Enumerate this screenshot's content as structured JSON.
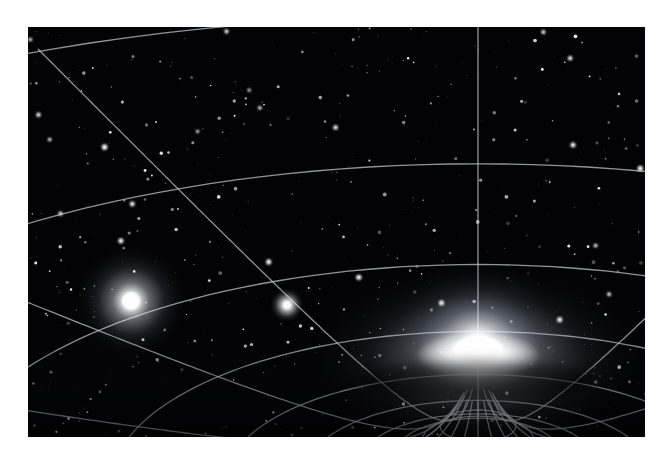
{
  "figure": {
    "kind": "spacetime-curvature-visualization",
    "frame": {
      "image_width": 668,
      "image_height": 458,
      "border_color": "#ffffff",
      "content_left": 28,
      "content_top": 27,
      "content_width": 617,
      "content_height": 410
    }
  },
  "colors": {
    "space_background": "#030305",
    "grid_line": "#c9cdd6",
    "grid_line_bright": "#ffffff",
    "star_white": "#ffffff",
    "well_glow": "#ffffff",
    "halo_blue_tint": "#dfe6f2"
  },
  "chart_data": {
    "type": "scatter",
    "xlabel": "",
    "ylabel": "",
    "grid": true,
    "legend": false,
    "xlim": [
      0,
      617
    ],
    "ylim": [
      0,
      410
    ],
    "annotations": [
      "Deformed coordinate mesh of radial and concentric lines",
      "Grid lines converge and compress toward the massive object",
      "Background starfield visible through the mesh"
    ],
    "objects": [
      {
        "name": "gravity-well-core",
        "label": "Massive object / gravity well",
        "x": 450,
        "y": 328,
        "radius": 14,
        "brightness": 1.0,
        "glow_radius": 150
      },
      {
        "name": "left-star",
        "label": "Bright foreground star",
        "x": 103,
        "y": 274,
        "radius": 9,
        "brightness": 0.92,
        "glow_radius": 58
      },
      {
        "name": "mid-star",
        "label": "Small star near grid crossing",
        "x": 259,
        "y": 278,
        "radius": 4,
        "brightness": 0.85,
        "glow_radius": 18
      }
    ],
    "grid_description": {
      "radial_lines": 17,
      "concentric_lines": 12,
      "focus_x": 450,
      "focus_y": 328,
      "line_width": 1.3,
      "line_opacity": 0.72
    },
    "starfield": {
      "count": 520,
      "min_radius": 0.3,
      "max_radius": 1.9,
      "seed": 20240517
    }
  },
  "labels": {
    "scene_alt": "Illustration of curved spacetime: a glowing mass sits at the center of a funnel-shaped grid of white lines against a starfield.",
    "well_label": "gravity well",
    "star_label": "star",
    "grid_label": "spacetime grid"
  }
}
